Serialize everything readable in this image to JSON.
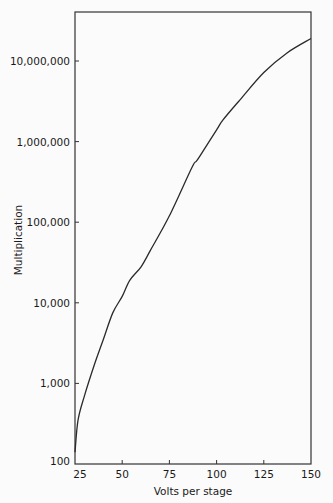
{
  "chart_data": {
    "type": "line",
    "title": "",
    "xlabel": "Volts per stage",
    "ylabel": "Multiplication",
    "xscale": "linear",
    "yscale": "log",
    "xlim": [
      25,
      150
    ],
    "ylim": [
      100,
      50000000
    ],
    "grid": false,
    "legend": null,
    "x_ticks": [
      25,
      50,
      75,
      100,
      125,
      150
    ],
    "x_tick_labels": [
      "25",
      "50",
      "75",
      "100",
      "125",
      "150"
    ],
    "y_ticks": [
      100,
      1000,
      10000,
      100000,
      1000000,
      10000000
    ],
    "y_tick_labels": [
      "100",
      "1,000",
      "10,000",
      "100,000",
      "1,000,000",
      "10,000,000"
    ],
    "series": [
      {
        "name": "Multiplication",
        "x": [
          25,
          26.6,
          30,
          35.6,
          40,
          45,
          50,
          54,
          60,
          65,
          75,
          87,
          90,
          100,
          103.4,
          112.4,
          125,
          137.3,
          150
        ],
        "y": [
          140,
          350,
          700,
          1800,
          3500,
          7500,
          12000,
          19000,
          28000,
          45000,
          120000,
          480000,
          600000,
          1400000,
          1860000,
          3300000,
          7200000,
          12600000,
          19000000
        ]
      }
    ]
  },
  "frame": {
    "left": 75,
    "right": 311,
    "top": 12,
    "bottom": 464,
    "px_per_decade": 80.6
  },
  "colors": {
    "line": "#2a2a2a",
    "axis": "#333333",
    "background": "#fbfbfb"
  }
}
